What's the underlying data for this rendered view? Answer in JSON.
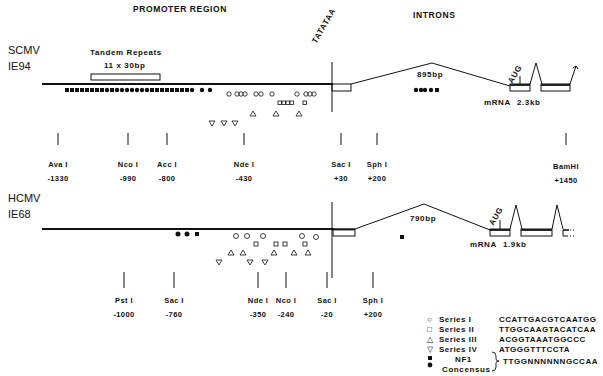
{
  "headers": {
    "promoter_region": "PROMOTER REGION",
    "introns": "INTRONS"
  },
  "scmv": {
    "name": "SCMV",
    "gene": "IE94",
    "tandem_repeats_title": "Tandem Repeats",
    "tandem_repeats_detail": "11 x 30bp",
    "tatataa": "TATATAA",
    "intron_size": "895bp",
    "aug": "AUG",
    "mrna": "mRNA",
    "mrna_size": "2.3kb",
    "sites": [
      {
        "name": "Ava I",
        "pos": "-1330",
        "x": 58
      },
      {
        "name": "Nco I",
        "pos": "-990",
        "x": 128
      },
      {
        "name": "Acc I",
        "pos": "-800",
        "x": 167
      },
      {
        "name": "Nde I",
        "pos": "-430",
        "x": 244
      },
      {
        "name": "Sac I",
        "pos": "+30",
        "x": 341
      },
      {
        "name": "Sph I",
        "pos": "+200",
        "x": 377
      },
      {
        "name": "BamHI",
        "pos": "+1450",
        "x": 566
      }
    ]
  },
  "hcmv": {
    "name": "HCMV",
    "gene": "IE68",
    "intron_size": "790bp",
    "aug": "AUG",
    "mrna": "mRNA",
    "mrna_size": "1.9kb",
    "sites": [
      {
        "name": "Pst I",
        "pos": "-1000",
        "x": 124
      },
      {
        "name": "Sac I",
        "pos": "-760",
        "x": 174
      },
      {
        "name": "Nde I",
        "pos": "-350",
        "x": 258
      },
      {
        "name": "Nco I",
        "pos": "-240",
        "x": 286
      },
      {
        "name": "Sac I",
        "pos": "-20",
        "x": 327
      },
      {
        "name": "Sph I",
        "pos": "+200",
        "x": 373
      }
    ]
  },
  "legend": [
    {
      "symbol": "○",
      "name": "Series I",
      "sequence": "CCATTGACGTCAATGG"
    },
    {
      "symbol": "□",
      "name": "Series II",
      "sequence": "TTGGCAAGTACATCAA"
    },
    {
      "symbol": "△",
      "name": "Series III",
      "sequence": "ACGGTAAATGGCCC"
    },
    {
      "symbol": "▽",
      "name": "Series IV",
      "sequence": "ATGGGTTTCCTA"
    }
  ],
  "nf1": {
    "label_line1": "NF1",
    "label_line2": "Concensus",
    "sequence": "TTGGNNNNNNGCCAA"
  }
}
